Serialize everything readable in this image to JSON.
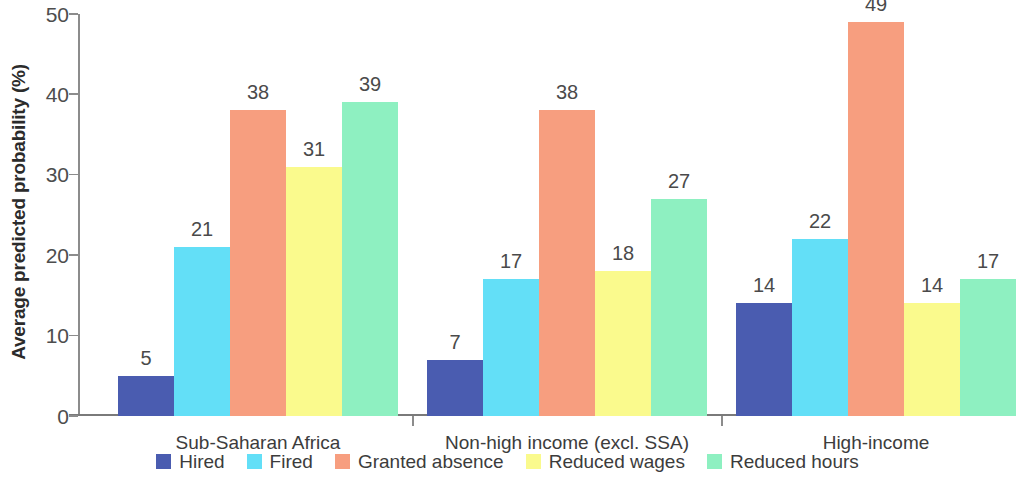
{
  "chart_data": {
    "type": "bar",
    "title": "",
    "subtitle": "",
    "xlabel": "",
    "ylabel": "Average predicted probability (%)",
    "ylim": [
      0,
      50
    ],
    "yticks": [
      0,
      10,
      20,
      30,
      40,
      50
    ],
    "ytick_labels": [
      "0",
      "10",
      "20",
      "30",
      "40",
      "50"
    ],
    "grid": false,
    "legend_position": "bottom",
    "categories": [
      "Sub-Saharan Africa",
      "Non-high income (excl. SSA)",
      "High-income"
    ],
    "series": [
      {
        "name": "Hired",
        "color": "#4a5cb0",
        "values": [
          5,
          7,
          14
        ],
        "labels": [
          "5",
          "7",
          "14"
        ]
      },
      {
        "name": "Fired",
        "color": "#63dff7",
        "values": [
          21,
          17,
          22
        ],
        "labels": [
          "21",
          "17",
          "22"
        ]
      },
      {
        "name": "Granted absence",
        "color": "#f79e7f",
        "values": [
          38,
          38,
          49
        ],
        "labels": [
          "38",
          "38",
          "49"
        ]
      },
      {
        "name": "Reduced wages",
        "color": "#fafa8d",
        "values": [
          31,
          18,
          14
        ],
        "labels": [
          "31",
          "18",
          "14"
        ]
      },
      {
        "name": "Reduced hours",
        "color": "#8ef0c1",
        "values": [
          39,
          27,
          17
        ],
        "labels": [
          "39",
          "27",
          "17"
        ]
      }
    ]
  },
  "axis": {
    "y_title": "Average predicted probability (%)",
    "y_tick_0": "0",
    "y_tick_1": "10",
    "y_tick_2": "20",
    "y_tick_3": "30",
    "y_tick_4": "40",
    "y_tick_5": "50"
  },
  "groups": [
    {
      "label": "Sub-Saharan Africa"
    },
    {
      "label": "Non-high income (excl. SSA)"
    },
    {
      "label": "High-income"
    }
  ],
  "legend": {
    "items": [
      {
        "label": "Hired",
        "color": "#4a5cb0"
      },
      {
        "label": "Fired",
        "color": "#63dff7"
      },
      {
        "label": "Granted absence",
        "color": "#f79e7f"
      },
      {
        "label": "Reduced wages",
        "color": "#fafa8d"
      },
      {
        "label": "Reduced hours",
        "color": "#8ef0c1"
      }
    ]
  }
}
